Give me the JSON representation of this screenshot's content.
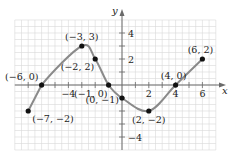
{
  "chart_data": {
    "type": "line",
    "title": "",
    "xlabel": "x",
    "ylabel": "y",
    "xlim": [
      -8,
      7
    ],
    "ylim": [
      -5,
      5
    ],
    "grid": true,
    "x_ticks": [
      -4,
      2,
      4,
      6
    ],
    "y_ticks": [
      4,
      2,
      -4
    ],
    "x_tick_labels": [
      "−4",
      "2",
      "4",
      "6"
    ],
    "y_tick_labels": [
      "4",
      "2",
      "−4"
    ],
    "series": [
      {
        "name": "f(x)",
        "x": [
          -7,
          -6,
          -3,
          -2,
          -1,
          0,
          2,
          4,
          6
        ],
        "values": [
          -2,
          0,
          3,
          2,
          0,
          -1,
          -2,
          0,
          2
        ]
      }
    ],
    "annotations": [
      {
        "point": [
          -7,
          -2
        ],
        "text": "(−7, −2)"
      },
      {
        "point": [
          -6,
          0
        ],
        "text": "(−6, 0)"
      },
      {
        "point": [
          -3,
          3
        ],
        "text": "(−3, 3)"
      },
      {
        "point": [
          -2,
          2
        ],
        "text": "(−2, 2)"
      },
      {
        "point": [
          -1,
          0
        ],
        "text": "(−1, 0)"
      },
      {
        "point": [
          0,
          -1
        ],
        "text": "(0, −1)"
      },
      {
        "point": [
          2,
          -2
        ],
        "text": "(2, −2)"
      },
      {
        "point": [
          4,
          0
        ],
        "text": "(4, 0)"
      },
      {
        "point": [
          6,
          2
        ],
        "text": "(6, 2)"
      }
    ],
    "colors": {
      "curve": "#8a8a8a",
      "points": "#111111",
      "grid": "#d8d8d8",
      "axis": "#6a6a6a"
    }
  }
}
